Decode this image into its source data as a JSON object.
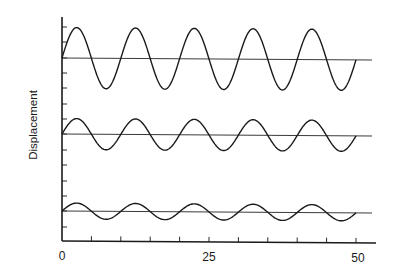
{
  "chart_data": {
    "type": "line",
    "title": "",
    "xlabel": "",
    "ylabel": "Displacement",
    "xlim": [
      0,
      53
    ],
    "x_ticks": [
      0,
      5,
      10,
      15,
      20,
      25,
      30,
      35,
      40,
      45,
      50
    ],
    "x_tick_labels": [
      "0",
      "25",
      "50"
    ],
    "x_tick_label_positions": [
      0,
      25,
      50
    ],
    "y_ticks_unlabeled": true,
    "grid": false,
    "legend": null,
    "series": [
      {
        "name": "large amplitude wave",
        "function": "sine",
        "baseline_offset": 3,
        "amplitude": 2,
        "period": 10,
        "x_range": [
          0,
          50
        ],
        "phase": 0
      },
      {
        "name": "medium amplitude wave",
        "function": "sine",
        "baseline_offset": -2,
        "amplitude": 1,
        "period": 10,
        "x_range": [
          0,
          50
        ],
        "phase": 0
      },
      {
        "name": "small amplitude wave",
        "function": "sine",
        "baseline_offset": -7,
        "amplitude": 0.5,
        "period": 10,
        "x_range": [
          0,
          50
        ],
        "phase": 0
      }
    ]
  },
  "axes": {
    "y_label": "Displacement",
    "x_labels": [
      "0",
      "25",
      "50"
    ]
  },
  "layout": {
    "origin_x": 62,
    "x_axis_y": 241,
    "px_per_unit_x": 5.88,
    "y_axis_top": 17,
    "y_tick_positions": [
      27,
      42,
      58,
      73,
      88,
      104,
      119,
      134,
      150,
      165,
      181,
      196,
      211,
      227
    ],
    "baselines_px": [
      58,
      134,
      211
    ],
    "amplitudes_px": [
      30.5,
      15.5,
      8
    ],
    "colors": {
      "ink": "#1a1a1a",
      "background": "#ffffff"
    }
  }
}
